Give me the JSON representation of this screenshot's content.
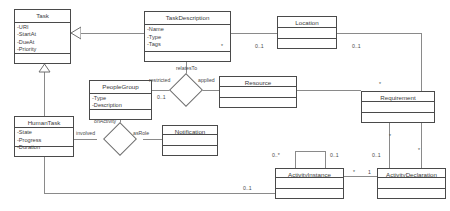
{
  "diagram": {
    "classes": [
      {
        "id": "task",
        "name": "Task",
        "attributes": [
          "-URI",
          "-StartAt",
          "-DueAt",
          "-Priority"
        ]
      },
      {
        "id": "task_description",
        "name": "TaskDescription",
        "attributes": [
          "-Name",
          "-Type",
          "-Tags"
        ]
      },
      {
        "id": "location",
        "name": "Location",
        "attributes": []
      },
      {
        "id": "people_group",
        "name": "PeopleGroup",
        "attributes": [
          "-Type",
          "-Description"
        ]
      },
      {
        "id": "resource",
        "name": "Resource",
        "attributes": []
      },
      {
        "id": "requirement",
        "name": "Requirement",
        "attributes": []
      },
      {
        "id": "human_task",
        "name": "HumanTask",
        "attributes": [
          "-State",
          "-Progress",
          "-Duration"
        ]
      },
      {
        "id": "notification",
        "name": "Notification",
        "attributes": []
      },
      {
        "id": "activity_instance",
        "name": "ActivityInstance",
        "attributes": []
      },
      {
        "id": "activity_declaration",
        "name": "ActivityDeclaration",
        "attributes": []
      }
    ],
    "association_labels": {
      "relates_to": "relatesTo",
      "restricted": "restricted",
      "applied": "applied",
      "on_activity": "onActivity",
      "involved": "involved",
      "as_role": "asRole"
    },
    "multiplicities": {
      "td_star": "*",
      "td_location": "0..1",
      "location_right": "0..1",
      "people_group_diamond": "0..1",
      "requirement_star_top": "*",
      "ai_zero_star": "0..*",
      "ai_zero_one": "0..1",
      "ad_zero_one": "0..1",
      "ad_star_top": "*",
      "requirement_star_mid": "*",
      "ai_star": "*",
      "ad_one": "1",
      "bottom_zero_one": "0..1"
    },
    "colors": {
      "stroke": "#4a4a4a",
      "connector": "#8a8a8a",
      "text": "#3a3a3a",
      "background": "#ffffff"
    }
  }
}
